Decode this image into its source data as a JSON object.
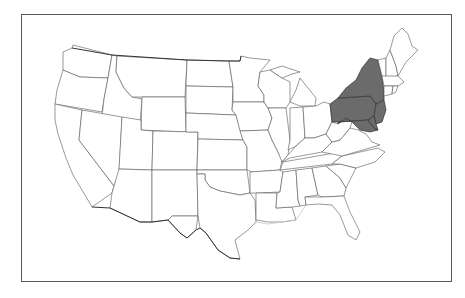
{
  "map": {
    "title": "",
    "region": "Contiguous United States",
    "highlight_color": "#6b6b6b",
    "base_color": "#ffffff",
    "border_color": "#555555",
    "frame_color": "#5a5a5a",
    "highlighted_states": [
      "New York",
      "Pennsylvania",
      "New Jersey",
      "Delaware",
      "Maryland"
    ]
  }
}
